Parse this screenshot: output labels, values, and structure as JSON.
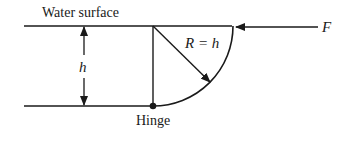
{
  "diagram": {
    "labels": {
      "water_surface": "Water surface",
      "depth": "h",
      "radius": "R = h",
      "force": "F",
      "hinge": "Hinge"
    },
    "colors": {
      "stroke": "#1a1a1a",
      "background": "#ffffff"
    }
  }
}
